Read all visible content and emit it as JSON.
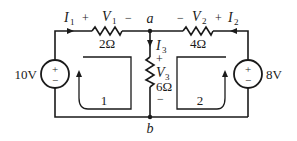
{
  "circuit": {
    "nodes": {
      "a": {
        "label": "a"
      },
      "b": {
        "label": "b"
      }
    },
    "sources": [
      {
        "id": "source-left",
        "value_label": "10V",
        "plus": "+",
        "minus": "−"
      },
      {
        "id": "source-right",
        "value_label": "8V",
        "plus": "+",
        "minus": "−"
      }
    ],
    "resistors": [
      {
        "id": "r1",
        "resistance": "2Ω",
        "voltage_label": "V",
        "voltage_sub": "1",
        "plus": "+",
        "minus": "−"
      },
      {
        "id": "r2",
        "resistance": "4Ω",
        "voltage_label": "V",
        "voltage_sub": "2",
        "plus": "+",
        "minus": "−"
      },
      {
        "id": "r3",
        "resistance": "6Ω",
        "voltage_label": "V",
        "voltage_sub": "3",
        "plus": "+",
        "minus": "−"
      }
    ],
    "currents": [
      {
        "id": "i1",
        "label": "I",
        "sub": "1"
      },
      {
        "id": "i2",
        "label": "I",
        "sub": "2"
      },
      {
        "id": "i3",
        "label": "I",
        "sub": "3"
      }
    ],
    "loops": [
      {
        "id": "loop-1",
        "label": "1"
      },
      {
        "id": "loop-2",
        "label": "2"
      }
    ]
  },
  "colors": {
    "wire": "#1a1a1a",
    "background": "#ffffff"
  }
}
